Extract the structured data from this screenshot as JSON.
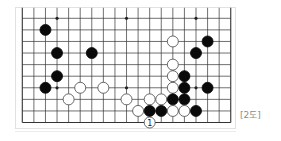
{
  "diagram": {
    "caption": "[2도]",
    "board": {
      "board_size": 19,
      "visible_columns": 19,
      "visible_rows": 10,
      "edges": {
        "left": true,
        "right": true,
        "bottom": true,
        "top": false
      },
      "origin_px": [
        22.3,
        18.3
      ],
      "spacing_px": 11.58,
      "line_color": "#333333",
      "star_points": [
        [
          3,
          0
        ],
        [
          9,
          0
        ],
        [
          15,
          0
        ],
        [
          3,
          6
        ],
        [
          9,
          6
        ],
        [
          15,
          6
        ]
      ],
      "stones": [
        {
          "color": "black",
          "col": 2,
          "row": 1
        },
        {
          "color": "black",
          "col": 3,
          "row": 3
        },
        {
          "color": "black",
          "col": 6,
          "row": 3
        },
        {
          "color": "white",
          "col": 13,
          "row": 2
        },
        {
          "color": "black",
          "col": 16,
          "row": 2
        },
        {
          "color": "black",
          "col": 15,
          "row": 3
        },
        {
          "color": "white",
          "col": 13,
          "row": 4
        },
        {
          "color": "black",
          "col": 3,
          "row": 5
        },
        {
          "color": "white",
          "col": 13,
          "row": 5
        },
        {
          "color": "black",
          "col": 14,
          "row": 5
        },
        {
          "color": "black",
          "col": 2,
          "row": 6
        },
        {
          "color": "white",
          "col": 5,
          "row": 6
        },
        {
          "color": "white",
          "col": 7,
          "row": 6
        },
        {
          "color": "white",
          "col": 13,
          "row": 6
        },
        {
          "color": "black",
          "col": 14,
          "row": 6
        },
        {
          "color": "black",
          "col": 16,
          "row": 6
        },
        {
          "color": "white",
          "col": 4,
          "row": 7
        },
        {
          "color": "white",
          "col": 9,
          "row": 7
        },
        {
          "color": "white",
          "col": 11,
          "row": 7
        },
        {
          "color": "white",
          "col": 12,
          "row": 7
        },
        {
          "color": "black",
          "col": 13,
          "row": 7
        },
        {
          "color": "black",
          "col": 14,
          "row": 7
        },
        {
          "color": "white",
          "col": 10,
          "row": 8
        },
        {
          "color": "black",
          "col": 11,
          "row": 8
        },
        {
          "color": "black",
          "col": 12,
          "row": 8
        },
        {
          "color": "white",
          "col": 13,
          "row": 8
        },
        {
          "color": "white",
          "col": 14,
          "row": 8
        },
        {
          "color": "black",
          "col": 15,
          "row": 8
        },
        {
          "color": "white",
          "col": 11,
          "row": 9,
          "label": "1"
        }
      ]
    }
  }
}
